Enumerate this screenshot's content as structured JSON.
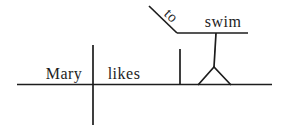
{
  "diagram": {
    "labels": {
      "subject": "Mary",
      "verb": "likes",
      "particle": "to",
      "infinitive": "swim"
    },
    "colors": {
      "line": "#1d1d1d",
      "text": "#1d1d1d",
      "background": "#ffffff"
    }
  }
}
